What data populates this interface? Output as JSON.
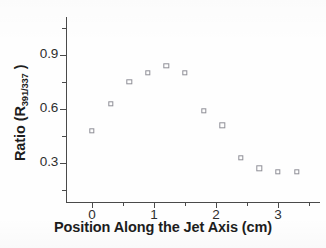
{
  "chart_data": {
    "type": "scatter",
    "title": "",
    "xlabel": "Position Along the Jet Axis (cm)",
    "ylabel_text": "Ratio (R",
    "ylabel_sub": "391/337",
    "ylabel_tail": " )",
    "ylabel_full": "Ratio (R391/337 )",
    "xlim": [
      -0.45,
      3.7
    ],
    "ylim": [
      0.12,
      1.03
    ],
    "xticks": [
      0,
      1,
      2,
      3
    ],
    "xtick_labels": [
      "0",
      "1",
      "2",
      "3"
    ],
    "yticks": [
      0.3,
      0.6,
      0.9
    ],
    "ytick_labels": [
      "0.3",
      "0.6",
      "0.9"
    ],
    "xticks_minor": [
      -0.5,
      0.5,
      1.5,
      2.5,
      3.5
    ],
    "yticks_minor": [
      0.15,
      0.45,
      0.75,
      1.05
    ],
    "grid": false,
    "legend": "none",
    "marker": "open-square",
    "marker_color": "#8f8f97",
    "axis_color": "#4a4a4a",
    "series": [
      {
        "name": "R391/337 vs position",
        "x": [
          0.0,
          0.3,
          0.6,
          0.9,
          1.2,
          1.5,
          1.8,
          2.1,
          2.4,
          2.7,
          3.0,
          3.3
        ],
        "y": [
          0.48,
          0.63,
          0.75,
          0.8,
          0.84,
          0.8,
          0.59,
          0.51,
          0.33,
          0.27,
          0.25,
          0.25
        ]
      }
    ]
  },
  "figure": {
    "background": "#ffffff",
    "text_color": "#1d1d1d"
  }
}
